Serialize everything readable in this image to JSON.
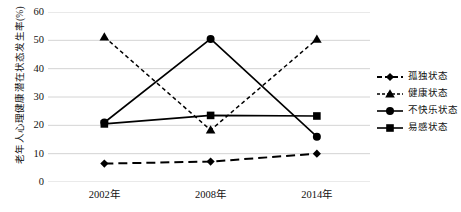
{
  "chart_data": {
    "type": "line",
    "title": "",
    "xlabel": "",
    "ylabel": "老年人心理健康潜在状态发生率(%)",
    "categories": [
      "2002年",
      "2008年",
      "2014年"
    ],
    "ylim": [
      0,
      60
    ],
    "ytick_step": 10,
    "yticks": [
      "0",
      "10",
      "20",
      "30",
      "40",
      "50",
      "60"
    ],
    "grid": "horizontal",
    "legend_position": "right",
    "series": [
      {
        "name": "孤独状态",
        "marker": "diamond",
        "line_style": "dashed",
        "color": "#000000",
        "values": [
          6.5,
          7.2,
          10.0
        ]
      },
      {
        "name": "健康状态",
        "marker": "triangle",
        "line_style": "dotted",
        "color": "#000000",
        "values": [
          51.2,
          18.3,
          50.4
        ]
      },
      {
        "name": "不快乐状态",
        "marker": "circle",
        "line_style": "solid",
        "color": "#000000",
        "values": [
          21.0,
          50.5,
          16.0
        ]
      },
      {
        "name": "易感状态",
        "marker": "square",
        "line_style": "solid",
        "color": "#000000",
        "values": [
          20.5,
          23.5,
          23.3
        ]
      }
    ]
  }
}
